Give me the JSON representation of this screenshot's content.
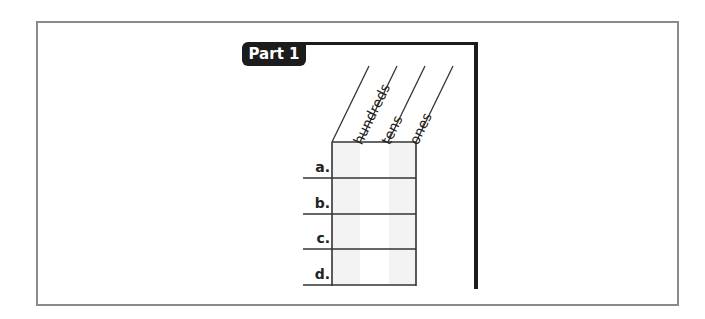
{
  "part": {
    "label": "Part 1"
  },
  "columns": [
    {
      "label": "hundreds"
    },
    {
      "label": "tens"
    },
    {
      "label": "ones"
    }
  ],
  "rows": [
    {
      "label": "a."
    },
    {
      "label": "b."
    },
    {
      "label": "c."
    },
    {
      "label": "d."
    }
  ],
  "colors": {
    "ink": "#1c1c1c",
    "frame": "#8a8a8a",
    "shade": "#f4f4f4"
  }
}
